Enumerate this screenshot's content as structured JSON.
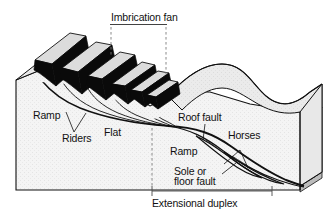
{
  "figure": {
    "kind": "geological-block-diagram",
    "background_color": "#ffffff",
    "ink_color": "#111111"
  },
  "labels": {
    "imbrication_fan": "Imbrication fan",
    "ramp_left": "Ramp",
    "riders": "Riders",
    "flat": "Flat",
    "roof_fault": "Roof fault",
    "horses": "Horses",
    "ramp_right": "Ramp",
    "sole_line1": "Sole or",
    "sole_line2": "floor fault",
    "extensional_duplex": "Extensional duplex"
  },
  "colors": {
    "block_front_face": "#f2f2f2",
    "block_top_face": "#e6e6e6",
    "block_right_face": "#ededed",
    "thrust_slice_dark": "#0a0a0a",
    "thrust_slice_top": "#d9d9d9",
    "basal_layer": "#c9c9c9",
    "dashed_leader": "#7d7d7d",
    "outline": "#111111"
  },
  "structure": {
    "imbricate_slice_count": 6,
    "horse_count": 2,
    "rider_pointer_count": 2
  }
}
